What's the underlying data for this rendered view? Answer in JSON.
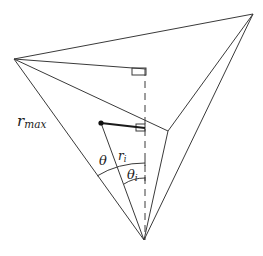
{
  "diagram": {
    "colors": {
      "line": "#3a3a3a",
      "point": "#111111",
      "background": "#ffffff"
    },
    "labels": {
      "r_max": "r",
      "r_max_sub": "max",
      "r_i": "r",
      "r_i_sub": "i",
      "theta": "θ",
      "theta_i": "θ",
      "theta_i_sub": "i"
    },
    "vertices": {
      "apex": [
        144,
        240
      ],
      "left": [
        14,
        59
      ],
      "top_right": [
        253,
        14
      ],
      "inner": [
        168,
        131
      ],
      "foot_top": [
        145,
        73
      ],
      "foot_ri": [
        145,
        128
      ],
      "point": [
        101,
        123
      ]
    }
  }
}
